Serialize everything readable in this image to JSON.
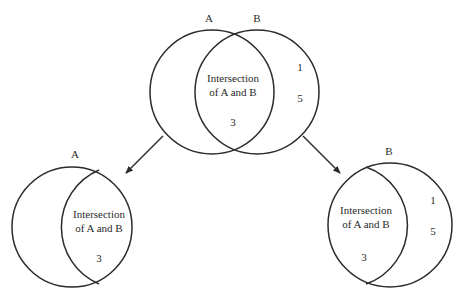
{
  "diagram": {
    "type": "venn-decomposition",
    "colors": {
      "stroke": "#2b2b2b",
      "text": "#2a2a2a",
      "background": "#ffffff"
    },
    "top": {
      "set_a_label": "A",
      "set_b_label": "B",
      "intersection_line1": "Intersection",
      "intersection_line2": "of A and B",
      "intersection_value": "3",
      "b_only_values": [
        "1",
        "5"
      ]
    },
    "bottom_left": {
      "set_label": "A",
      "intersection_line1": "Intersection",
      "intersection_line2": "of A and B",
      "intersection_value": "3"
    },
    "bottom_right": {
      "set_label": "B",
      "intersection_line1": "Intersection",
      "intersection_line2": "of A and B",
      "intersection_value": "3",
      "b_only_values": [
        "1",
        "5"
      ]
    }
  }
}
